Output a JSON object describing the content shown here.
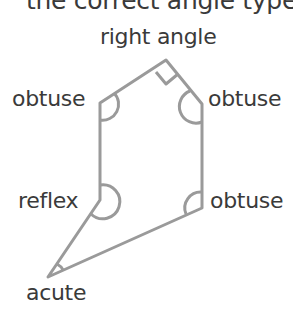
{
  "header": {
    "text": "the correct angle types,"
  },
  "labels": {
    "top": "right angle",
    "upper_left": "obtuse",
    "upper_right": "obtuse",
    "lower_left": "reflex",
    "lower_right": "obtuse",
    "bottom": "acute"
  },
  "colors": {
    "line": "#9a9a9a",
    "text": "#3a3a3a"
  }
}
